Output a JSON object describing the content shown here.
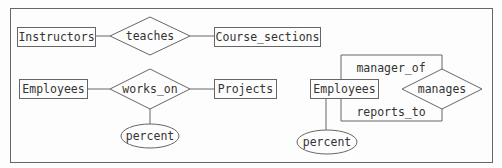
{
  "diagram": {
    "type": "entity-relationship",
    "stroke_color": "#666666",
    "text_color": "#333333",
    "entities": [
      {
        "id": "instructors",
        "label": "Instructors"
      },
      {
        "id": "course_sections",
        "label": "Course_sections"
      },
      {
        "id": "employees_1",
        "label": "Employees"
      },
      {
        "id": "projects",
        "label": "Projects"
      },
      {
        "id": "employees_2",
        "label": "Employees"
      }
    ],
    "relationships": [
      {
        "id": "teaches",
        "label": "teaches"
      },
      {
        "id": "works_on",
        "label": "works_on"
      },
      {
        "id": "manages",
        "label": "manages"
      }
    ],
    "attributes": [
      {
        "id": "percent_1",
        "label": "percent"
      },
      {
        "id": "percent_2",
        "label": "percent"
      }
    ],
    "roles": [
      {
        "id": "manager_of",
        "label": "manager_of"
      },
      {
        "id": "reports_to",
        "label": "reports_to"
      }
    ]
  }
}
